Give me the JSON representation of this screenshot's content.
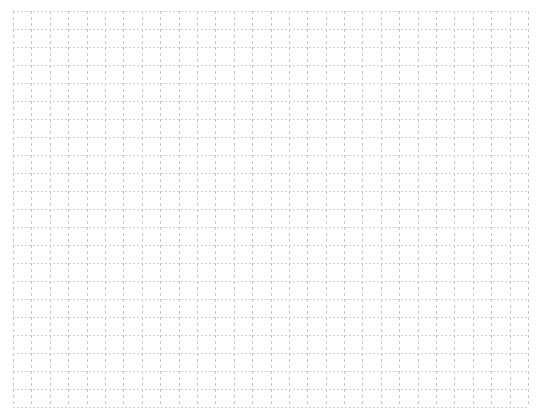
{
  "canvas": {
    "width": 546,
    "height": 417,
    "background_color": "#ffffff",
    "content_description": "blank dotted graph-paper grid",
    "text_content": "",
    "labels": []
  },
  "grid": {
    "name": "dotted-grid",
    "origin_x": 13,
    "origin_y": 11,
    "width": 515,
    "height": 396,
    "columns": 28,
    "rows": 22,
    "cell_width": 18.4,
    "cell_height": 18.0,
    "line_style": "dotted",
    "vertical_line_color": "#c3c3ca",
    "horizontal_line_color": "#cdcdd2",
    "vertical_dash_on": 3,
    "vertical_dash_off": 3,
    "horizontal_dash_on": 2,
    "horizontal_dash_off": 2,
    "line_width": 1,
    "border": "none",
    "fill_color": "#ffffff"
  },
  "chart_data": {
    "type": "table",
    "title": "",
    "xlabel": "",
    "ylabel": "",
    "categories": [],
    "values": [],
    "grid": true,
    "legend": false,
    "annotations": [],
    "note": "Empty grid canvas - no data series plotted"
  }
}
